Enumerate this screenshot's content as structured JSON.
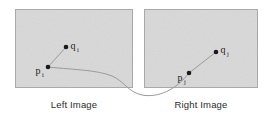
{
  "figure": {
    "name": "stereo-correspondence-pair",
    "background_color": "#ffffff",
    "panel_fill": "#dcdcdc",
    "panel_border_color": "#a9a9a9",
    "line_color": "#9a9a9a",
    "point_color": "#1a1a1a",
    "label_color": "#1a1a1a",
    "caption_color": "#2b2b2b"
  },
  "panels": [
    {
      "id": "left-image-panel",
      "caption": "Left Image",
      "x": 15,
      "y": 9,
      "width": 118,
      "height": 79,
      "points": [
        {
          "id": "p-i",
          "label": "p",
          "subscript": "i",
          "cx": 48,
          "cy": 67,
          "label_x": 38,
          "label_y": 74,
          "label_side": "left"
        },
        {
          "id": "q-i",
          "label": "q",
          "subscript": "i",
          "cx": 66,
          "cy": 47,
          "label_x": 71,
          "label_y": 49,
          "label_side": "right"
        }
      ],
      "segment": {
        "from": "p-i",
        "to": "q-i"
      }
    },
    {
      "id": "right-image-panel",
      "caption": "Right Image",
      "x": 144,
      "y": 9,
      "width": 114,
      "height": 79,
      "points": [
        {
          "id": "p-j",
          "label": "p",
          "subscript": "j",
          "cx": 189,
          "cy": 73,
          "label_x": 180,
          "label_y": 81,
          "label_side": "left"
        },
        {
          "id": "q-j",
          "label": "q",
          "subscript": "j",
          "cx": 216,
          "cy": 52,
          "label_x": 221,
          "label_y": 53,
          "label_side": "right"
        }
      ],
      "segment": {
        "from": "p-j",
        "to": "q-j"
      }
    }
  ],
  "connector_curve": {
    "id": "match-curve",
    "description": "curve linking p-i in the left image to p-j in the right image",
    "path": "M 48 67 C 78 70, 96 70, 112 76 C 124 81, 128 92, 142 95 C 158 98, 176 90, 189 73",
    "stroke": "#9a9a9a",
    "stroke_width": 1
  },
  "captions": {
    "left": "Left Image",
    "right": "Right Image"
  }
}
